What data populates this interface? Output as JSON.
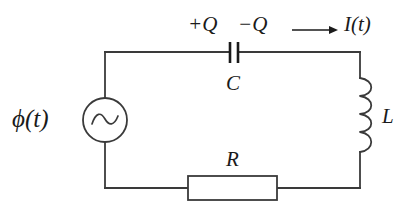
{
  "figure": {
    "background_color": "#ffffff",
    "line_color": "#3a3a3a",
    "text_color": "#1a1a1a"
  },
  "labels": {
    "source": "ϕ(t)",
    "charge_positive": "+Q",
    "charge_negative": "−Q",
    "current": "I(t)",
    "capacitor": "C",
    "inductor": "L",
    "resistor": "R"
  },
  "components": {
    "ac_source": {
      "name": "ac-voltage-source",
      "symbol": "circle-with-sine-wave",
      "center_x": 105,
      "center_y": 120,
      "radius": 22
    },
    "capacitor": {
      "name": "capacitor",
      "symbol": "two-parallel-plates",
      "plate1_x": 230,
      "plate2_x": 238,
      "plate_top_y": 42,
      "plate_bottom_y": 63
    },
    "inductor": {
      "name": "inductor",
      "symbol": "four-coil-loops",
      "coil_count": 4,
      "x": 360,
      "top_y": 78,
      "bottom_y": 152
    },
    "resistor": {
      "name": "resistor",
      "symbol": "open-rectangle",
      "left_x": 188,
      "right_x": 277,
      "top_y": 176,
      "bottom_y": 200
    },
    "current_arrow": {
      "name": "current-direction-arrow",
      "direction": "right",
      "start_x": 292,
      "end_x": 338,
      "y": 30
    }
  },
  "wires": {
    "loop_left_x": 105,
    "loop_right_x": 360,
    "loop_top_y": 52,
    "loop_bottom_y": 188
  }
}
